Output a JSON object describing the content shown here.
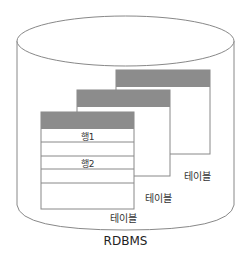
{
  "diagram": {
    "container_label": "RDBMS",
    "tables": [
      {
        "label": "테이블",
        "rows": [
          "행1",
          "행2"
        ]
      },
      {
        "label": "테이블"
      },
      {
        "label": "테이블"
      }
    ],
    "colors": {
      "header": "#8c8c8c",
      "stroke": "#777777"
    }
  }
}
